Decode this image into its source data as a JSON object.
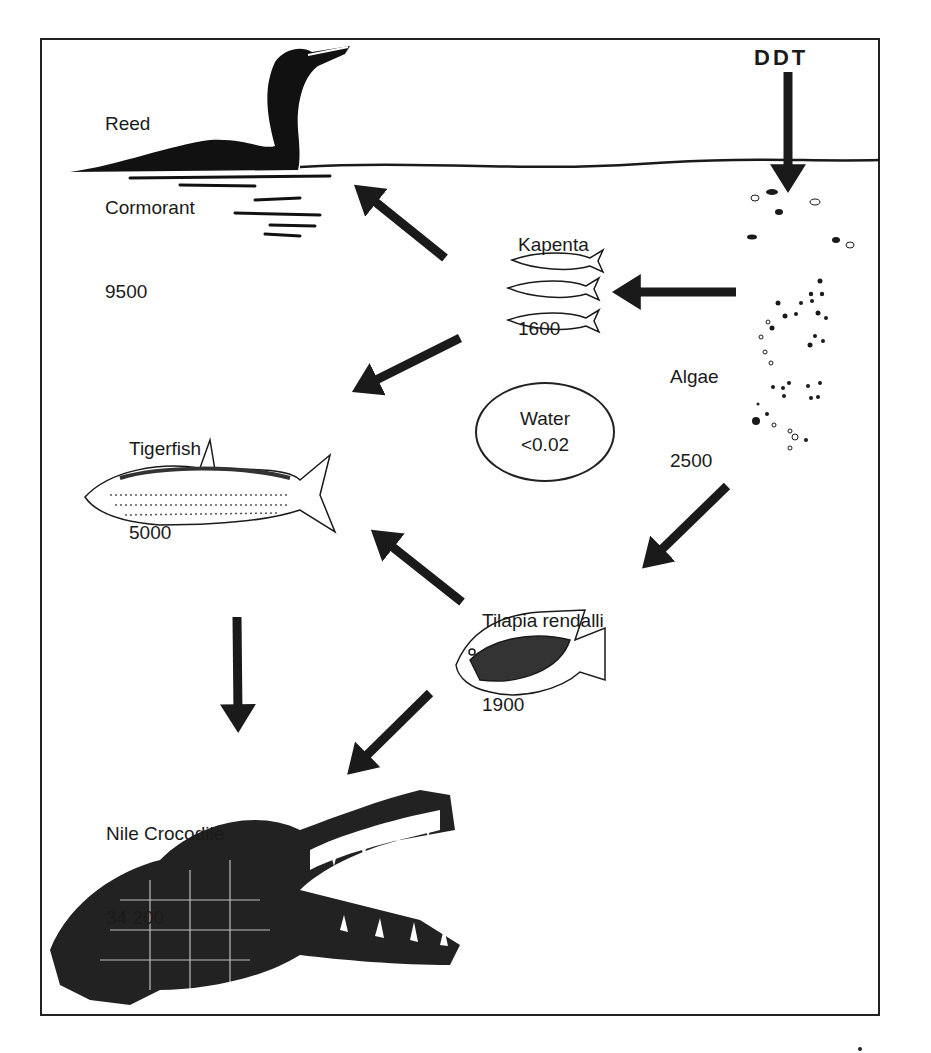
{
  "diagram": {
    "source": {
      "label": "DDT"
    },
    "nodes": {
      "cormorant": {
        "name_line1": "Reed",
        "name_line2": "Cormorant",
        "value": "9500",
        "icon": "cormorant-icon"
      },
      "kapenta": {
        "name": "Kapenta",
        "value": "1600",
        "icon": "kapenta-fish-icon"
      },
      "algae": {
        "name": "Algae",
        "value": "2500",
        "icon": "algae-icon"
      },
      "tigerfish": {
        "name": "Tigerfish",
        "value": "5000",
        "icon": "tigerfish-icon"
      },
      "water": {
        "name": "Water",
        "value": "<0.02"
      },
      "tilapia": {
        "name": "Tilapia rendalli",
        "value": "1900",
        "icon": "tilapia-icon"
      },
      "crocodile": {
        "name": "Nile Crocodile",
        "value": "34 200",
        "icon": "crocodile-icon"
      }
    },
    "edges": [
      {
        "from": "DDT",
        "to": "Algae"
      },
      {
        "from": "Algae",
        "to": "Kapenta"
      },
      {
        "from": "Kapenta",
        "to": "Reed Cormorant"
      },
      {
        "from": "Kapenta",
        "to": "Tigerfish"
      },
      {
        "from": "Algae",
        "to": "Tilapia rendalli"
      },
      {
        "from": "Tilapia rendalli",
        "to": "Tigerfish"
      },
      {
        "from": "Tigerfish",
        "to": "Nile Crocodile"
      },
      {
        "from": "Tilapia rendalli",
        "to": "Nile Crocodile"
      }
    ],
    "colors": {
      "ink": "#1a1a1a",
      "background": "#ffffff"
    }
  }
}
